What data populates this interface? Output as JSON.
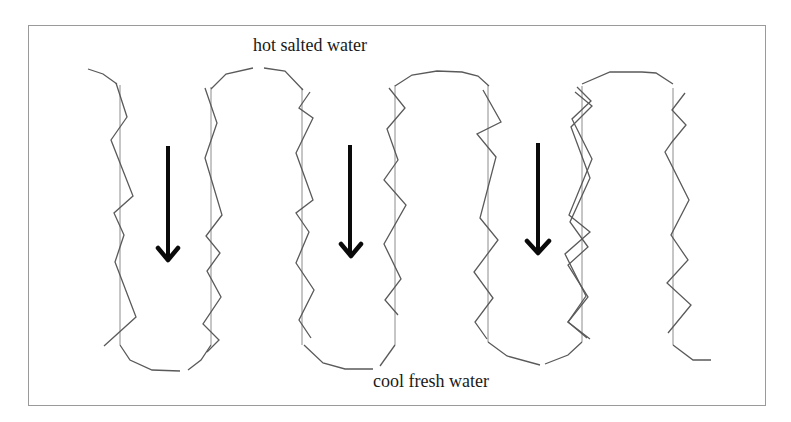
{
  "diagram": {
    "labels": {
      "top": "hot salted water",
      "bottom": "cool fresh water"
    },
    "flow_direction": "downward",
    "arrow_count": 3,
    "channel_count": 4,
    "colors": {
      "background": "#ffffff",
      "frame": "#9a9a9a",
      "wall_line": "#8c8c8c",
      "zigzag": "#5a5a5a",
      "arrow": "#0a0a0a",
      "text": "#1a1a1a"
    }
  }
}
